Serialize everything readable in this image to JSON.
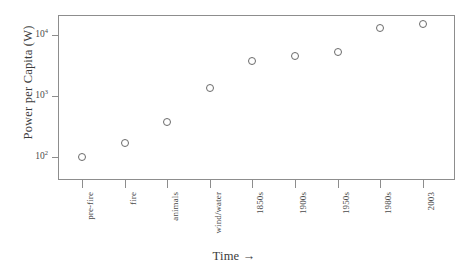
{
  "chart_data": {
    "type": "scatter",
    "title": "",
    "xlabel": "Time →",
    "ylabel": "Power per Capita (W)",
    "categories": [
      "pre-fire",
      "fire",
      "animals",
      "wind/water",
      "1850s",
      "1900s",
      "1950s",
      "1980s",
      "2003"
    ],
    "values": [
      100,
      170,
      380,
      1350,
      3700,
      4500,
      5200,
      13000,
      15000
    ],
    "yscale": "log",
    "ylim": [
      60,
      30000
    ],
    "ytick_values": [
      100,
      1000,
      10000
    ],
    "ytick_labels": [
      "10²",
      "10³",
      "10⁴"
    ],
    "ytick_mantissas": [
      "10",
      "10",
      "10"
    ],
    "ytick_exponents": [
      "2",
      "3",
      "4"
    ],
    "grid": false,
    "legend": false,
    "marker": "open-circle",
    "marker_color": "#6a6a6a",
    "frame_color": "#8d8d8d",
    "text_color": "#4a4a4a",
    "background": "#ffffff"
  },
  "axes": {
    "y_title": "Power per Capita (W)",
    "x_title": "Time →"
  }
}
